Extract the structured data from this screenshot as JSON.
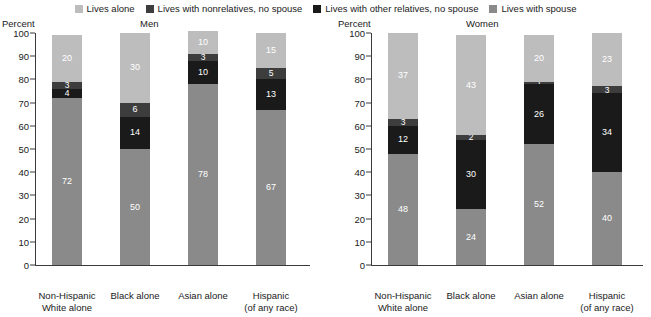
{
  "legend": {
    "items": [
      {
        "label": "Lives alone",
        "color": "#bdbdbd"
      },
      {
        "label": "Lives with nonrelatives, no spouse",
        "color": "#3d3d3d"
      },
      {
        "label": "Lives with other relatives, no spouse",
        "color": "#1a1a1a"
      },
      {
        "label": "Lives with spouse",
        "color": "#8a8a8a"
      }
    ]
  },
  "axis": {
    "caption": "Percent",
    "ticks": [
      "100",
      "90",
      "80",
      "70",
      "60",
      "50",
      "40",
      "30",
      "20",
      "10",
      "0"
    ],
    "min": 0,
    "max": 100
  },
  "chart_data": {
    "type": "bar",
    "title": "",
    "xlabel": "",
    "ylabel": "Percent",
    "ylim": [
      0,
      100
    ],
    "grid": false,
    "legend_position": "top",
    "stacked": true,
    "panels": [
      {
        "title": "Men",
        "categories": [
          {
            "line1": "Non-Hispanic",
            "line2": "White alone"
          },
          {
            "line1": "Black alone",
            "line2": ""
          },
          {
            "line1": "Asian alone",
            "line2": ""
          },
          {
            "line1": "Hispanic",
            "line2": "(of any race)"
          }
        ],
        "series": [
          {
            "name": "Lives with spouse",
            "color": "#8a8a8a",
            "values": [
              72,
              50,
              78,
              67
            ]
          },
          {
            "name": "Lives with other relatives, no spouse",
            "color": "#1a1a1a",
            "values": [
              4,
              14,
              10,
              13
            ]
          },
          {
            "name": "Lives with nonrelatives, no spouse",
            "color": "#3d3d3d",
            "values": [
              3,
              6,
              3,
              5
            ]
          },
          {
            "name": "Lives alone",
            "color": "#bdbdbd",
            "values": [
              20,
              30,
              10,
              15
            ]
          }
        ]
      },
      {
        "title": "Women",
        "categories": [
          {
            "line1": "Non-Hispanic",
            "line2": "White alone"
          },
          {
            "line1": "Black alone",
            "line2": ""
          },
          {
            "line1": "Asian alone",
            "line2": ""
          },
          {
            "line1": "Hispanic",
            "line2": "(of any race)"
          }
        ],
        "series": [
          {
            "name": "Lives with spouse",
            "color": "#8a8a8a",
            "values": [
              48,
              24,
              52,
              40
            ]
          },
          {
            "name": "Lives with other relatives, no spouse",
            "color": "#1a1a1a",
            "values": [
              12,
              30,
              26,
              34
            ]
          },
          {
            "name": "Lives with nonrelatives, no spouse",
            "color": "#3d3d3d",
            "values": [
              3,
              2,
              1,
              3
            ]
          },
          {
            "name": "Lives alone",
            "color": "#bdbdbd",
            "values": [
              37,
              43,
              20,
              23
            ]
          }
        ]
      }
    ]
  }
}
